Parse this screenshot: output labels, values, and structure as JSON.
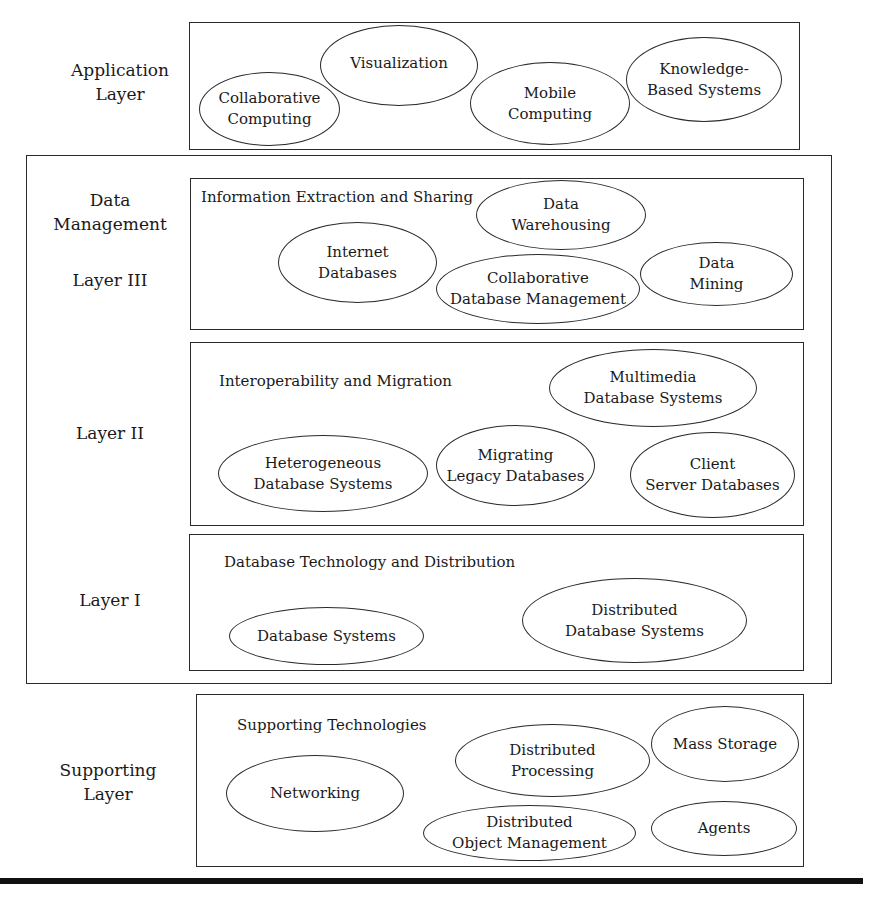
{
  "layers": {
    "application": {
      "label": "Application\nLayer",
      "items": [
        "Collaborative\nComputing",
        "Visualization",
        "Mobile\nComputing",
        "Knowledge-\nBased Systems"
      ]
    },
    "data_management": {
      "label": "Data\nManagement",
      "layer3": {
        "label": "Layer III",
        "title": "Information Extraction and Sharing",
        "items": [
          "Data\nWarehousing",
          "Internet\nDatabases",
          "Collaborative\nDatabase Management",
          "Data\nMining"
        ]
      },
      "layer2": {
        "label": "Layer II",
        "title": "Interoperability and Migration",
        "items": [
          "Multimedia\nDatabase Systems",
          "Heterogeneous\nDatabase Systems",
          "Migrating\nLegacy Databases",
          "Client\nServer Databases"
        ]
      },
      "layer1": {
        "label": "Layer I",
        "title": "Database Technology and Distribution",
        "items": [
          "Database Systems",
          "Distributed\nDatabase Systems"
        ]
      }
    },
    "supporting": {
      "label": "Supporting\nLayer",
      "title": "Supporting Technologies",
      "items": [
        "Networking",
        "Distributed\nProcessing",
        "Mass Storage",
        "Distributed\nObject Management",
        "Agents"
      ]
    }
  },
  "colors": {
    "line": "#2a2a2a",
    "text": "#1a1a1a",
    "background": "#ffffff"
  }
}
